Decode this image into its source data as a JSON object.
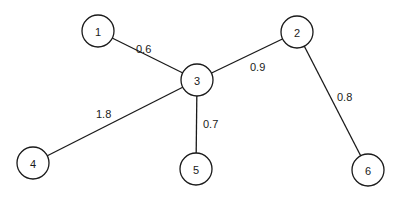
{
  "diagram": {
    "type": "weighted-graph",
    "nodes": [
      {
        "id": "1",
        "label": "1",
        "x": 98,
        "y": 31
      },
      {
        "id": "2",
        "label": "2",
        "x": 297,
        "y": 32
      },
      {
        "id": "3",
        "label": "3",
        "x": 197,
        "y": 80
      },
      {
        "id": "4",
        "label": "4",
        "x": 33,
        "y": 163
      },
      {
        "id": "5",
        "label": "5",
        "x": 196,
        "y": 169
      },
      {
        "id": "6",
        "label": "6",
        "x": 368,
        "y": 170
      }
    ],
    "edges": [
      {
        "from": "1",
        "to": "3",
        "weight": "0.6",
        "label_x": 136,
        "label_y": 53
      },
      {
        "from": "3",
        "to": "2",
        "weight": "0.9",
        "label_x": 250,
        "label_y": 71
      },
      {
        "from": "2",
        "to": "6",
        "weight": "0.8",
        "label_x": 337,
        "label_y": 101
      },
      {
        "from": "3",
        "to": "4",
        "weight": "1.8",
        "label_x": 96,
        "label_y": 118
      },
      {
        "from": "3",
        "to": "5",
        "weight": "0.7",
        "label_x": 203,
        "label_y": 128
      }
    ]
  }
}
